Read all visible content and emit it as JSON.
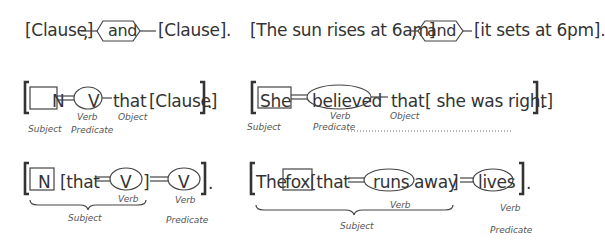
{
  "row1": {
    "left": {
      "clause1": "[Clause]",
      "comma": ",",
      "conjunction": "and",
      "clause2": "[Clause].",
      "clause2_end": "."
    },
    "right": {
      "clause1": "[The  sun rises at 6am]",
      "comma": ",",
      "conjunction": "and",
      "clause2": "[it sets at 6pm]."
    }
  },
  "row2": {
    "left": {
      "noun": "N",
      "verb": "V",
      "that": "that",
      "clause": "[Clause]",
      "end": "].",
      "labels": {
        "verb": "Verb",
        "object": "Object",
        "subject": "Subject",
        "predicate": "Predicate"
      }
    },
    "right": {
      "noun": "She",
      "verb": "believed",
      "that": "that",
      "clause": "[ she was right]",
      "end": "].",
      "labels": {
        "verb": "Verb",
        "object": "Object",
        "subject": "Subject",
        "predicate": "Predicate",
        "predicate_dots": "....................................................................................................."
      }
    }
  },
  "row3": {
    "left": {
      "noun": "N",
      "rel_open": "[that",
      "verb1": "V",
      "rel_close": "]",
      "verb2": "V",
      "end": "].",
      "labels": {
        "verb1": "Verb",
        "verb2": "Verb",
        "subject": "Subject",
        "predicate": "Predicate"
      }
    },
    "right": {
      "det": "The",
      "noun": "fox",
      "rel_open": "[that",
      "verb1": "runs",
      "adv": "away",
      "rel_close": "]",
      "verb2": "lives",
      "end": "].",
      "labels": {
        "verb1": "Verb",
        "verb2": "Verb",
        "subject": "Subject",
        "predicate": "Predicate"
      }
    }
  }
}
